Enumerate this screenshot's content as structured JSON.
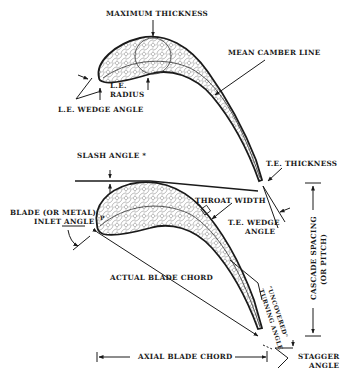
{
  "diagram": {
    "colors": {
      "ink": "#1a1a1a",
      "hatch": "#555555",
      "background": "#ffffff"
    },
    "labels": {
      "maximum_thickness": "MAXIMUM THICKNESS",
      "mean_camber_line": "MEAN CAMBER LINE",
      "le_radius_1": "L.E.",
      "le_radius_2": "RADIUS",
      "le_wedge_angle": "L.E. WEDGE ANGLE",
      "slash_angle": "SLASH ANGLE *",
      "te_thickness": "T.E. THICKNESS",
      "throat_width": "THROAT WIDTH",
      "te_wedge_angle_1": "T.E. WEDGE",
      "te_wedge_angle_2": "ANGLE",
      "blade_inlet_angle_1": "BLADE (OR METAL)",
      "blade_inlet_angle_2": "INLET ANGLE",
      "actual_blade_chord": "ACTUAL BLADE CHORD",
      "uncovered_turning_angle_1": "\"UNCOVERED\"",
      "uncovered_turning_angle_2": "TURNING ANGLE",
      "cascade_spacing_1": "CASCADE SPACING",
      "cascade_spacing_2": "(OR PITCH)",
      "axial_blade_chord": "AXIAL BLADE CHORD",
      "stagger_angle_1": "STAGGER",
      "stagger_angle_2": "ANGLE",
      "point_p": "P"
    }
  }
}
